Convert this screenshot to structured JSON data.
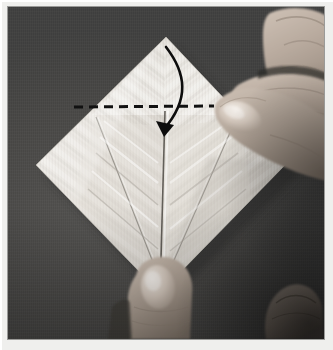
{
  "image": {
    "kind": "instructional-photograph",
    "subject": "origami-folding-step",
    "width_px": 333,
    "height_px": 350,
    "color_mode": "grayscale",
    "alt_text": "Two hands folding a square sheet of white paper oriented as a diamond on a dark gray surface; a dashed horizontal fold line crosses the upper part of the diamond and a curved arrow points from the top point downward."
  },
  "frame": {
    "mount_color": "#efefed",
    "photo_border_color": "#9a9a98",
    "photo_left": 8,
    "photo_top": 7,
    "photo_width": 316,
    "photo_height": 332
  },
  "scene": {
    "background_color": "#4a4947",
    "background_description": "dark gray textured mat",
    "paper_color": "#e9e7e2",
    "paper_shadow_color": "#2e2d2c",
    "paper_description": "square sheet of white paper rotated 45 degrees into a diamond, pre-creased with diagonal pleats"
  },
  "paper": {
    "vertices": {
      "top": [
        158,
        30
      ],
      "left": [
        28,
        158
      ],
      "right": [
        278,
        157
      ],
      "bottom": [
        152,
        286
      ]
    },
    "creases": [
      "vertical center crease from top point to bottom point",
      "left diagonal flap crease",
      "right diagonal flap crease",
      "chevron pleat texture on both halves"
    ]
  },
  "annotations": {
    "fold_line": {
      "name": "valley-fold-line",
      "style": "dashed",
      "color": "#121212",
      "dash_pattern": "9 6",
      "stroke_width": 3,
      "x_start": 74,
      "x_end": 212,
      "y": 100
    },
    "arrow": {
      "name": "fold-direction-arrow",
      "style": "curved-solid",
      "color": "#0d0d0d",
      "stroke_width": 2.6,
      "start": [
        160,
        45
      ],
      "end": [
        154,
        128
      ],
      "head_length": 11,
      "meaning": "fold the top point down along the dashed line"
    }
  },
  "hands": [
    {
      "name": "right-hand-thumb-top",
      "position": "upper right",
      "description": "thumb and index finger pressing the right edge of the paper at the fold line",
      "skin_color": "#b9aca0"
    },
    {
      "name": "left-hand-thumb-bottom",
      "position": "bottom center",
      "description": "thumb holding the bottom point of the diamond",
      "skin_color": "#b5a89c"
    },
    {
      "name": "finger-bottom-right",
      "position": "bottom right corner",
      "description": "fingertip resting on the mat",
      "skin_color": "#8e857c"
    }
  ],
  "labels": {
    "figure_title": "",
    "step_number": "",
    "caption": ""
  }
}
